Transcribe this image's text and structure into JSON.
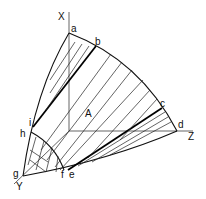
{
  "diagram": {
    "axes": {
      "x": "X",
      "y": "Y",
      "z": "Z"
    },
    "region_label": "A",
    "points": {
      "a": "a",
      "b": "b",
      "c": "c",
      "d": "d",
      "e": "e",
      "f": "f",
      "g": "g",
      "h": "h",
      "i": "i"
    }
  }
}
